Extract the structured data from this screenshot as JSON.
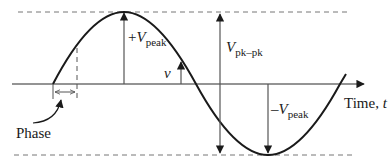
{
  "diagram": {
    "type": "sine-wave-annotated",
    "colors": {
      "curve": "#1a1a1a",
      "axis": "#2a2a2a",
      "arrow": "#555555",
      "dashed": "#777777",
      "background": "#ffffff"
    }
  },
  "labels": {
    "plus_vpeak": {
      "sign": "+",
      "main": "V",
      "sub": "peak"
    },
    "vpkpk": {
      "main": "V",
      "sub": "pk–pk"
    },
    "minus_vpeak": {
      "sign": "–",
      "main": "V",
      "sub": "peak"
    },
    "v": "v",
    "time_axis": {
      "prefix": "Time, ",
      "var": "t"
    },
    "phase": "Phase"
  }
}
